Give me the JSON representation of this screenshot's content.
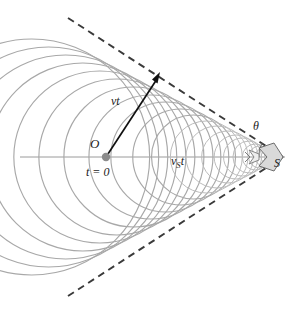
{
  "figure": {
    "background_color": "#ffffff",
    "width": 298,
    "height": 311
  },
  "colors": {
    "wavefront": "#a8a8a8",
    "wavefront_dense": "#bcbcbc",
    "axis": "#9a9a9a",
    "cone_dashed": "#3a3a3a",
    "arrow": "#101010",
    "origin_dot": "#8c8c8c",
    "source_fill": "#d9d9d9",
    "source_stroke": "#6e6e6e",
    "label_text": "#1a1a1a"
  },
  "labels": {
    "origin": "O",
    "time_zero": "t = 0",
    "sound_distance": "vt",
    "source_distance_v": "v",
    "source_distance_sub": "S",
    "source_distance_t": "t",
    "mach_angle": "θ",
    "source": "S"
  },
  "icons": {
    "origin_dot": "origin-dot-icon",
    "source_marker": "airplane-source-icon",
    "angle_arc": "angle-arc-icon",
    "arrowhead": "arrowhead-icon"
  },
  "chart_data": {
    "type": "diagram",
    "diagram_kind": "mach-cone-wavefronts",
    "axis_line": {
      "x1": 20,
      "y1": 157,
      "x2": 285,
      "y2": 157
    },
    "origin": {
      "x": 106,
      "y": 157,
      "label": "O",
      "time_label": "t = 0"
    },
    "apex": {
      "x": 283,
      "y": 157,
      "label": "S"
    },
    "mach_half_angle_deg": 28,
    "cone_lines": [
      {
        "name": "upper-cone-edge",
        "x1": 68,
        "y1": 18,
        "x2": 283,
        "y2": 157,
        "style": "dashed"
      },
      {
        "name": "lower-cone-edge",
        "x1": 68,
        "y1": 296,
        "x2": 283,
        "y2": 157,
        "style": "dashed"
      }
    ],
    "vt_arrow": {
      "x1": 106,
      "y1": 157,
      "x2": 160,
      "y2": 73,
      "label": "vt"
    },
    "vst_segment": {
      "x1": 106,
      "y1": 157,
      "x2": 283,
      "y2": 157,
      "label": "vSt"
    },
    "wavefronts_description": "Concentric circular wavefronts emitted at successive times, each tangent to the two dashed cone edges; centers lie on the horizontal axis and radii shrink toward the apex.",
    "wavefront_count": 22,
    "wavefront_radii": [
      118,
      110,
      102,
      94,
      86,
      78,
      70,
      62,
      55,
      48,
      42,
      36,
      31,
      26,
      22,
      19,
      16,
      13,
      11,
      9,
      7,
      5
    ],
    "legend_position": "none",
    "grid": false
  }
}
